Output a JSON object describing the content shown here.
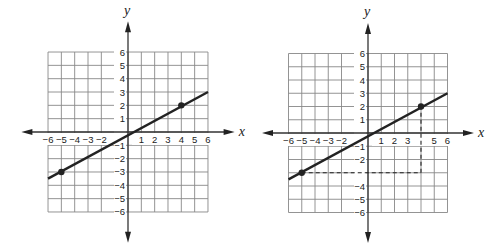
{
  "chart_data": [
    {
      "type": "line",
      "title": "",
      "xlabel": "x",
      "ylabel": "y",
      "xlim": [
        -6,
        6
      ],
      "ylim": [
        -6,
        6
      ],
      "grid": true,
      "x_ticks": [
        -6,
        -5,
        -4,
        -3,
        -2,
        1,
        2,
        3,
        4,
        5,
        6
      ],
      "y_ticks": [
        6,
        5,
        4,
        3,
        2,
        1,
        -1,
        -2,
        -3,
        -4,
        -5,
        -6
      ],
      "series": [
        {
          "name": "line",
          "x": [
            -6,
            6
          ],
          "y": [
            -3.5,
            3
          ]
        }
      ],
      "points": [
        {
          "x": -5,
          "y": -3
        },
        {
          "x": 4,
          "y": 2
        }
      ],
      "annotations": []
    },
    {
      "type": "line",
      "title": "",
      "xlabel": "x",
      "ylabel": "y",
      "xlim": [
        -6,
        6
      ],
      "ylim": [
        -6,
        6
      ],
      "grid": true,
      "x_ticks": [
        -6,
        -5,
        -4,
        -3,
        -2,
        1,
        2,
        3,
        5,
        6
      ],
      "y_ticks": [
        6,
        5,
        4,
        3,
        2,
        1,
        -1,
        -2,
        -4,
        -5,
        -6
      ],
      "series": [
        {
          "name": "line",
          "x": [
            -6,
            6
          ],
          "y": [
            -3.5,
            3
          ]
        }
      ],
      "points": [
        {
          "x": -5,
          "y": -3
        },
        {
          "x": 4,
          "y": 2
        }
      ],
      "annotations": [
        {
          "type": "dashed-line",
          "from": [
            -5,
            -3
          ],
          "to": [
            4,
            -3
          ]
        },
        {
          "type": "dashed-line",
          "from": [
            4,
            -3
          ],
          "to": [
            4,
            2
          ]
        }
      ]
    }
  ]
}
